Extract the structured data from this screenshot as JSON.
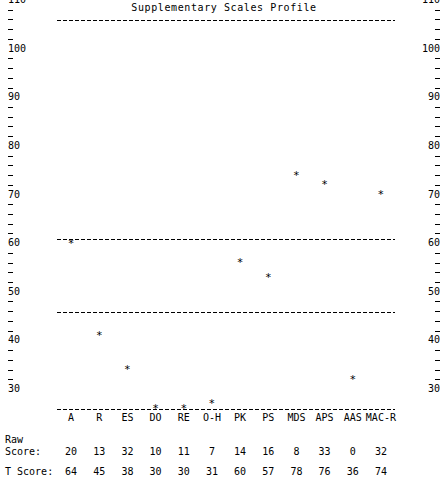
{
  "chart_data": {
    "type": "scatter",
    "title": "Supplementary Scales Profile",
    "xlabel": "",
    "ylabel": "",
    "ylim": [
      30,
      110
    ],
    "y_major_step": 10,
    "y_minor_step": 2,
    "grid": false,
    "legend_position": "none",
    "marker_symbol": "*",
    "categories": [
      "A",
      "R",
      "ES",
      "DO",
      "RE",
      "O-H",
      "PK",
      "PS",
      "MDS",
      "APS",
      "AAS",
      "MAC-R"
    ],
    "values": [
      64,
      45,
      38,
      30,
      30,
      31,
      60,
      57,
      78,
      76,
      36,
      74
    ],
    "series": [
      {
        "name": "T Score",
        "values": [
          64,
          45,
          38,
          30,
          30,
          31,
          60,
          57,
          78,
          76,
          36,
          74
        ]
      }
    ],
    "raw_scores": [
      20,
      13,
      32,
      10,
      11,
      7,
      14,
      16,
      8,
      33,
      0,
      32
    ],
    "reference_lines": [
      110,
      65,
      50,
      30
    ],
    "y_tick_labels": [
      "110",
      "100",
      "90",
      "80",
      "70",
      "60",
      "50",
      "40",
      "30"
    ],
    "y_tick_values": [
      110,
      100,
      90,
      80,
      70,
      60,
      50,
      40,
      30
    ],
    "axis_left_labels": [
      "110",
      "100",
      "90",
      "80",
      "70",
      "60",
      "50",
      "40",
      "30"
    ],
    "axis_right_labels": [
      "110",
      "100",
      "90",
      "80",
      "70",
      "60",
      "50",
      "40",
      "30"
    ]
  },
  "table": {
    "raw_label_line1": "Raw",
    "raw_label_line2": "Score:",
    "t_label": "T Score:",
    "columns": [
      "A",
      "R",
      "ES",
      "DO",
      "RE",
      "O-H",
      "PK",
      "PS",
      "MDS",
      "APS",
      "AAS",
      "MAC-R"
    ],
    "raw_scores": [
      "20",
      "13",
      "32",
      "10",
      "11",
      "7",
      "14",
      "16",
      "8",
      "33",
      "0",
      "32"
    ],
    "t_scores": [
      "64",
      "45",
      "38",
      "30",
      "30",
      "31",
      "60",
      "57",
      "78",
      "76",
      "36",
      "74"
    ]
  },
  "colors": {
    "foreground": "#000000",
    "background": "#ffffff"
  }
}
